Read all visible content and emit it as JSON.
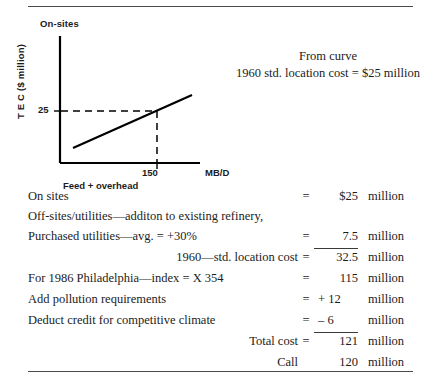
{
  "figure": {
    "title": "On-sites",
    "ylabel": "T E C ($ million)",
    "xlabel": "Feed + overhead",
    "xunit": "MB/D",
    "ytick": "25",
    "xtick": "150"
  },
  "annotation": {
    "line1": "From curve",
    "line2": "1960 std. location cost = $25 million"
  },
  "chart_data": {
    "type": "line",
    "title": "On-sites",
    "xlabel": "Feed + overhead",
    "ylabel": "T E C ($ million)",
    "xunit": "MB/D",
    "grid": false,
    "legend": false,
    "xticks": [
      "150"
    ],
    "yticks": [
      "25"
    ],
    "series": [
      {
        "name": "On-sites TEC curve",
        "x": [
          55,
          230
        ],
        "y": [
          11,
          33
        ]
      }
    ],
    "readout": {
      "label": "1960 std. location cost",
      "x": 150,
      "y": 25,
      "value": "$25 million",
      "guides": "dashed"
    },
    "xlim": [
      0,
      240
    ],
    "ylim": [
      0,
      47
    ]
  },
  "cost_table": {
    "rows": [
      {
        "desc": "On sites",
        "align": "left",
        "eq": "=",
        "value": "$25",
        "unit": "million",
        "ruled": false,
        "sign": false
      },
      {
        "desc": "Off-sites/utilities—additon to existing refinery,",
        "align": "left",
        "eq": "",
        "value": "",
        "unit": "",
        "ruled": false,
        "sign": false
      },
      {
        "desc": "Purchased utilities—avg. = +30%",
        "align": "left",
        "eq": "=",
        "value": "7.5",
        "unit": "million",
        "ruled": true,
        "sign": false
      },
      {
        "desc": "1960—std. location cost",
        "align": "right",
        "eq": "=",
        "value": "32.5",
        "unit": "million",
        "ruled": false,
        "sign": false
      },
      {
        "desc": "For 1986 Philadelphia—index = X 354",
        "align": "left",
        "eq": "=",
        "value": "115",
        "unit": "million",
        "ruled": false,
        "sign": false
      },
      {
        "desc": "Add pollution requirements",
        "align": "left",
        "eq": "=",
        "value": "+ 12",
        "unit": "million",
        "ruled": false,
        "sign": true
      },
      {
        "desc": "Deduct credit for competitive climate",
        "align": "left",
        "eq": "=",
        "value": "– 6",
        "unit": "million",
        "ruled": true,
        "sign": true
      },
      {
        "desc": "Total cost",
        "align": "right",
        "eq": "=",
        "value": "121",
        "unit": "million",
        "ruled": false,
        "sign": false
      },
      {
        "desc": "Call",
        "align": "right",
        "eq": "",
        "value": "120",
        "unit": "million",
        "ruled": false,
        "sign": false
      }
    ]
  },
  "colors": {
    "ink": "#1c1c1c",
    "rule": "#4a4a4a",
    "plot_line": "#000000"
  }
}
